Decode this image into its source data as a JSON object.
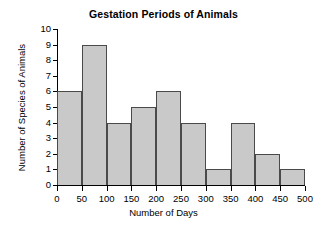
{
  "chart_data": {
    "type": "bar",
    "title": "Gestation Periods of Animals",
    "xlabel": "Number of Days",
    "ylabel": "Number of Species of Animals",
    "bin_width": 50,
    "bin_edges": [
      0,
      50,
      100,
      150,
      200,
      250,
      300,
      350,
      400,
      450,
      500
    ],
    "categories": [
      "0-50",
      "50-100",
      "100-150",
      "150-200",
      "200-250",
      "250-300",
      "300-350",
      "350-400",
      "400-450",
      "450-500"
    ],
    "values": [
      6,
      9,
      4,
      5,
      6,
      4,
      1,
      4,
      2,
      1
    ],
    "xlim": [
      0,
      500
    ],
    "ylim": [
      0,
      10
    ],
    "x_ticks": [
      0,
      50,
      100,
      150,
      200,
      250,
      300,
      350,
      400,
      450,
      500
    ],
    "x_tick_labels": [
      "0",
      "50",
      "100",
      "150",
      "200",
      "250",
      "300",
      "350",
      "400",
      "450",
      "500"
    ],
    "y_ticks": [
      0,
      1,
      2,
      3,
      4,
      5,
      6,
      7,
      8,
      9,
      10
    ],
    "y_tick_labels": [
      "0",
      "1",
      "2",
      "3",
      "4",
      "5",
      "6",
      "7",
      "8",
      "9",
      "10"
    ],
    "grid": false,
    "legend": false,
    "bar_fill_color": "#c9c9c9",
    "bar_edge_color": "#4a4a4a",
    "axis_color": "#000000",
    "background_color": "#ffffff"
  }
}
